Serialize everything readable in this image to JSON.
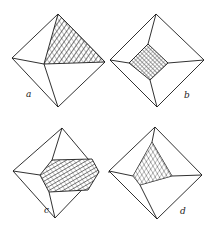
{
  "figure": {
    "colors": {
      "line": "#1a1a1a",
      "background": "#ffffff"
    },
    "panels": [
      {
        "id": "a",
        "label": "a",
        "shape": "octahedron with hatched triangular face (upper right)"
      },
      {
        "id": "b",
        "label": "b",
        "shape": "octahedron with hatched central square face"
      },
      {
        "id": "c",
        "label": "c",
        "shape": "octahedron with hatched central hexagonal face"
      },
      {
        "id": "d",
        "label": "d",
        "shape": "octahedron with hatched central triangular face"
      }
    ]
  }
}
